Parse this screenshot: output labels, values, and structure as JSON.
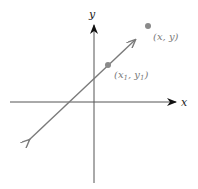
{
  "diagram": {
    "axes": {
      "x_label": "x",
      "y_label": "y",
      "color": "#555555",
      "arrow_color": "#111111"
    },
    "line": {
      "color": "#7a7a7a"
    },
    "points": [
      {
        "name": "point-x1-y1",
        "label": "(x1, y1)",
        "label_main_x": "(x",
        "sub1": "1",
        "comma": ", y",
        "sub2": "1",
        "close": ")",
        "color": "#8a8a8a"
      },
      {
        "name": "point-x-y",
        "label": "(x, y)",
        "color": "#8a8a8a"
      }
    ],
    "label_color": "#7a7a7a"
  }
}
